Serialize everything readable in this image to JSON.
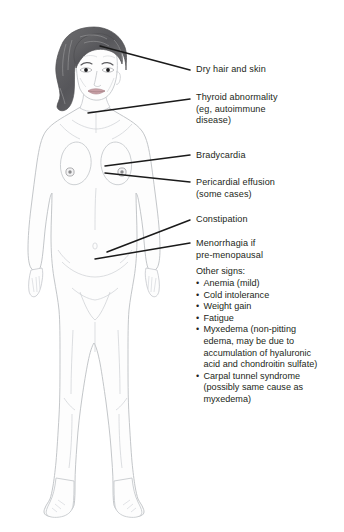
{
  "figure": {
    "colors": {
      "background": "#ffffff",
      "text": "#231f20",
      "leader_line": "#1a1a1a",
      "body_outline": "#b9bcc0",
      "body_fill": "#fdfdfd",
      "hair_dark": "#5b5b5d",
      "hair_mid": "#7e7e80",
      "hair_light": "#a9a9ab",
      "skin_line": "#c9ccd0",
      "lip": "#c49aa0",
      "eye": "#1a1a1a",
      "areola": "#9a9a9c"
    }
  },
  "callouts": [
    {
      "name": "dry-hair-and-skin",
      "lines": [
        "Dry hair and skin"
      ],
      "top": 64,
      "leader": {
        "x1": 100,
        "y1": 46,
        "x2": 190,
        "y2": 70
      }
    },
    {
      "name": "thyroid-abnormality",
      "lines": [
        "Thyroid abnormality",
        "(eg, autoimmune",
        "disease)"
      ],
      "top": 92,
      "leader": {
        "x1": 88,
        "y1": 113,
        "x2": 190,
        "y2": 99
      }
    },
    {
      "name": "bradycardia",
      "lines": [
        "Bradycardia"
      ],
      "top": 150,
      "leader": {
        "x1": 105,
        "y1": 166,
        "x2": 190,
        "y2": 155
      }
    },
    {
      "name": "pericardial-effusion",
      "lines": [
        "Pericardial effusion",
        "(some cases)"
      ],
      "top": 177,
      "leader": {
        "x1": 105,
        "y1": 173,
        "x2": 190,
        "y2": 182
      }
    },
    {
      "name": "constipation",
      "lines": [
        "Constipation"
      ],
      "top": 214,
      "leader": {
        "x1": 107,
        "y1": 252,
        "x2": 190,
        "y2": 220
      }
    },
    {
      "name": "menorrhagia",
      "lines": [
        "Menorrhagia if",
        "pre-menopausal"
      ],
      "top": 238,
      "leader": {
        "x1": 95,
        "y1": 259,
        "x2": 190,
        "y2": 243
      }
    }
  ],
  "other_signs": {
    "heading": "Other signs:",
    "heading_top": 266,
    "bullet_glyph": "•",
    "items": [
      {
        "name": "anemia",
        "lines": [
          "Anemia (mild)"
        ]
      },
      {
        "name": "cold-intolerance",
        "lines": [
          "Cold intolerance"
        ]
      },
      {
        "name": "weight-gain",
        "lines": [
          "Weight gain"
        ]
      },
      {
        "name": "fatigue",
        "lines": [
          "Fatigue"
        ]
      },
      {
        "name": "myxedema",
        "lines": [
          "Myxedema (non-pitting",
          "edema, may be due to",
          "accumulation of hyaluronic",
          "acid and chondroitin sulfate)"
        ]
      },
      {
        "name": "carpal-tunnel-syndrome",
        "lines": [
          "Carpal tunnel syndrome",
          "(possibly same cause as",
          "myxedema)"
        ]
      }
    ]
  }
}
